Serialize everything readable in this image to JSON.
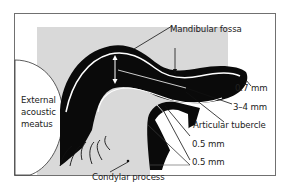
{
  "diagram": {
    "type": "anatomical-cross-section",
    "colors": {
      "frame": "#707070",
      "background": "#ffffff",
      "tissue_gray": "#d9d9d9",
      "bone_black": "#0a0a0a",
      "highlight_line": "#ffffff",
      "text": "#222222"
    },
    "labels": {
      "mandibular_fossa": "Mandibular fossa",
      "thickness_1": "0.7 mm",
      "thickness_2": "3–4 mm",
      "articular_tubercle": "Articular tubercle",
      "thickness_3": "0.5 mm",
      "thickness_4": "0.5 mm",
      "external_acoustic_meatus_line1": "External",
      "external_acoustic_meatus_line2": "acoustic",
      "external_acoustic_meatus_line3": "meatus",
      "condylar_process": "Condylar process"
    }
  }
}
